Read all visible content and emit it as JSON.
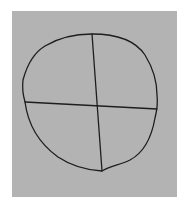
{
  "image": {
    "description": "Hand-drawn sketch of an irregular circle divided into four quadrants by a vertical and a horizontal line, on a gray paper background",
    "colors": {
      "page": "#ffffff",
      "paper": "#b3b3b3",
      "ink": "#1e1e1e"
    },
    "paper_rect": {
      "x": 12,
      "y": 11,
      "width": 165,
      "height": 186
    },
    "shapes": {
      "outline_path": "M92 34 C115 34 135 40 145 55 C153 68 157 82 157 95 C158 103 157 110 155 118 C152 135 145 152 130 160 C120 165 110 166 102 171 C85 170 70 165 58 157 C40 144 28 125 25 102 C23 95 22 88 23 80 C27 65 35 52 45 46 C60 37 75 34 92 34 Z",
      "vertical_line": {
        "x1": 92,
        "y1": 34,
        "x2": 102,
        "y2": 171
      },
      "horizontal_line": {
        "x1": 25,
        "y1": 102,
        "x2": 157,
        "y2": 109
      }
    }
  }
}
